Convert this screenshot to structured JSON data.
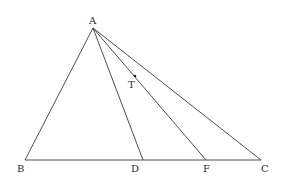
{
  "diagram": {
    "type": "geometry-triangle",
    "stroke_color": "#3a3a3a",
    "label_color": "#2a2a2a",
    "points": {
      "A": {
        "label": "A",
        "x": 93,
        "y": 28,
        "lx": 89,
        "ly": 24
      },
      "B": {
        "label": "B",
        "x": 25,
        "y": 160,
        "lx": 17,
        "ly": 172
      },
      "D": {
        "label": "D",
        "x": 143,
        "y": 160,
        "lx": 131,
        "ly": 172
      },
      "F": {
        "label": "F",
        "x": 206,
        "y": 160,
        "lx": 203,
        "ly": 172
      },
      "C": {
        "label": "C",
        "x": 261,
        "y": 160,
        "lx": 261,
        "ly": 172
      },
      "T": {
        "label": "T",
        "x": 135,
        "y": 76,
        "lx": 128,
        "ly": 88
      }
    },
    "segments": [
      {
        "name": "segment-AB",
        "from": "A",
        "to": "B"
      },
      {
        "name": "segment-AC",
        "from": "A",
        "to": "C"
      },
      {
        "name": "segment-AD",
        "from": "A",
        "to": "D"
      },
      {
        "name": "segment-AF",
        "from": "A",
        "to": "F"
      },
      {
        "name": "segment-BC",
        "from": "B",
        "to": "C"
      }
    ],
    "marked_points": [
      "T"
    ]
  }
}
